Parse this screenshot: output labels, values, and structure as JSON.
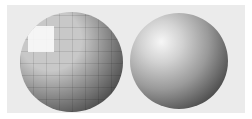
{
  "figure": {
    "left_sphere": {
      "label": "",
      "style": "flat/faceted shading"
    },
    "right_sphere": {
      "label": "",
      "style": "smooth shading"
    },
    "colors": {
      "panel": "#ebebeb",
      "background": "#ffffff",
      "highlight": "#f6f6f6",
      "shadow": "#262626"
    }
  }
}
